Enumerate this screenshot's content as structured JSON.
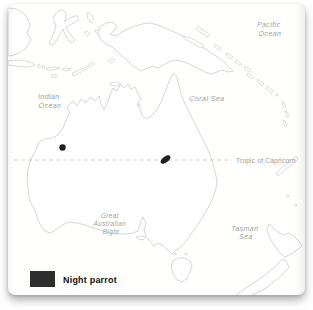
{
  "map": {
    "sea_labels": {
      "pacific": {
        "lines": [
          "Pacific",
          "Ocean"
        ]
      },
      "indian": {
        "lines": [
          "Indian",
          "Ocean"
        ]
      },
      "coral": {
        "lines": [
          "Coral Sea"
        ]
      },
      "tasman": {
        "lines": [
          "Tasman",
          "Sea"
        ]
      },
      "bight": {
        "lines": [
          "Great",
          "Australian",
          "Bight"
        ]
      }
    },
    "tropic_line": {
      "label": "Tropic of Capricorn",
      "style": "dashed"
    },
    "markers": [
      {
        "name": "western-record",
        "shape": "dot",
        "x": 62.5,
        "y": 147.5
      },
      {
        "name": "eastern-record",
        "shape": "streak",
        "x": 165.5,
        "y": 159.5
      }
    ],
    "colors": {
      "coastline": "#c8cdca",
      "sea_label_text": "#98a09e",
      "tropic_line": "#c3c3c3",
      "tropic_label_text": "#9b9b9b",
      "marker": "#1f1f1f"
    }
  },
  "legend": {
    "label": "Night parrot",
    "swatch_color": "#2e2e2e",
    "label_color": "#111111"
  }
}
